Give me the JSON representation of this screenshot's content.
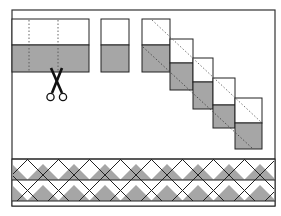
{
  "diagram": {
    "colors": {
      "background": "#ffffff",
      "frame": "#333333",
      "outline": "#222222",
      "shaded": "#a6a6a6",
      "light": "#ffffff",
      "dotted": "#555555"
    },
    "frame": {
      "x": 12,
      "y": 10,
      "width": 263,
      "height": 196
    },
    "strip_set": {
      "label": "strip-set",
      "x": 12,
      "y": 19,
      "width": 77,
      "height": 53,
      "split_y": 45,
      "cut_lines_x": [
        29,
        58
      ]
    },
    "scissors": {
      "label": "scissors-icon",
      "x": 45,
      "y": 70
    },
    "cut_segment": {
      "label": "cut-segment",
      "x": 101,
      "y": 19,
      "width": 28,
      "height": 53,
      "split_y": 45
    },
    "staircase": {
      "label": "offset-segments",
      "blocks": [
        {
          "x": 142,
          "y": 19,
          "w": 28,
          "h": 53,
          "split": 26
        },
        {
          "x": 170,
          "y": 39,
          "w": 23,
          "h": 51,
          "split": 24
        },
        {
          "x": 193,
          "y": 58,
          "w": 20,
          "h": 51,
          "split": 24
        },
        {
          "x": 213,
          "y": 78,
          "w": 22,
          "h": 50,
          "split": 27
        },
        {
          "x": 235,
          "y": 98,
          "w": 27,
          "h": 51,
          "split": 25
        }
      ],
      "diagonal_1": {
        "x1": 152,
        "y1": 20,
        "x2": 261,
        "y2": 122
      },
      "diagonal_2": {
        "x1": 143,
        "y1": 47,
        "x2": 252,
        "y2": 148
      }
    },
    "border_strip": {
      "label": "finished-border",
      "x": 12,
      "y": 159,
      "width": 263,
      "height": 47,
      "row1_top": 159,
      "row_mid": 180,
      "row2_bottom": 201,
      "triangle_period": 31,
      "offset": 0
    }
  }
}
